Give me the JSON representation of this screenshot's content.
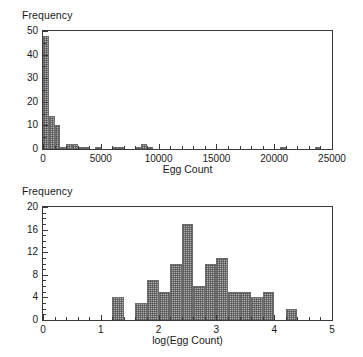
{
  "figure": {
    "panel_count": 2,
    "background": "#ffffff",
    "bar_fill": "#b0b0b0",
    "bar_edge": "#6d6d6d",
    "axis_color": "#3a3a3a"
  },
  "chart_data": [
    {
      "id": "egg-count-histogram",
      "type": "bar",
      "title": "",
      "xlabel": "Egg Count",
      "ylabel": "Frequency",
      "xlim": [
        0,
        25000
      ],
      "ylim": [
        0,
        50
      ],
      "xticks": [
        0,
        5000,
        10000,
        15000,
        20000,
        25000
      ],
      "xticklabels": [
        "0",
        "5000",
        "10000",
        "15000",
        "20000",
        "25000"
      ],
      "yticks": [
        0,
        10,
        20,
        30,
        40,
        50
      ],
      "yticklabels": [
        "0",
        "10",
        "20",
        "30",
        "40",
        "50"
      ],
      "minor_xtick_interval": 1000,
      "minor_ytick_interval": 5,
      "grid": false,
      "legend": "none",
      "bin_width": 500,
      "bin_starts": [
        0,
        500,
        1000,
        1500,
        2000,
        2500,
        3000,
        3500,
        4000,
        4500,
        5500,
        6000,
        6500,
        8000,
        8500,
        9000,
        20500,
        23500
      ],
      "values": [
        48,
        14,
        10,
        1,
        2,
        2,
        1,
        1,
        0,
        1,
        0,
        1,
        1,
        1,
        2,
        1,
        1,
        1
      ]
    },
    {
      "id": "log-egg-count-histogram",
      "type": "bar",
      "title": "",
      "xlabel": "log(Egg Count)",
      "ylabel": "Frequency",
      "xlim": [
        0,
        5
      ],
      "ylim": [
        0,
        20
      ],
      "xticks": [
        0,
        1,
        2,
        3,
        4,
        5
      ],
      "xticklabels": [
        "0",
        "1",
        "2",
        "3",
        "4",
        "5"
      ],
      "yticks": [
        0,
        4,
        8,
        12,
        16,
        20
      ],
      "yticklabels": [
        "0",
        "4",
        "8",
        "12",
        "16",
        "20"
      ],
      "minor_xtick_interval": 0.2,
      "minor_ytick_interval": 1,
      "grid": false,
      "legend": "none",
      "bin_width": 0.2,
      "bin_starts": [
        1.2,
        1.6,
        1.8,
        2.0,
        2.2,
        2.4,
        2.6,
        2.8,
        3.0,
        3.2,
        3.4,
        3.6,
        3.8,
        4.2
      ],
      "values": [
        4,
        3,
        7,
        5,
        10,
        17,
        6,
        10,
        11,
        5,
        5,
        4,
        5,
        2
      ]
    }
  ]
}
